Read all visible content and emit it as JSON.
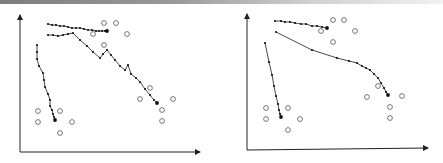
{
  "chart_data": [
    {
      "type": "scatter",
      "title": "",
      "xlabel": "",
      "ylabel": "",
      "grid": false,
      "panel": "left",
      "axes": {
        "origin": [
          20,
          152
        ],
        "x_end": [
          200,
          152
        ],
        "y_end": [
          20,
          15
        ]
      },
      "series": [
        {
          "name": "trajectory-top",
          "style": "dotted-line",
          "points": [
            [
              48,
              24
            ],
            [
              52,
              25
            ],
            [
              56,
              25
            ],
            [
              60,
              26
            ],
            [
              64,
              26
            ],
            [
              68,
              27
            ],
            [
              72,
              28
            ],
            [
              76,
              28
            ],
            [
              80,
              28
            ],
            [
              84,
              29
            ],
            [
              88,
              30
            ],
            [
              92,
              30
            ],
            [
              96,
              31
            ],
            [
              99,
              31
            ],
            [
              102,
              31
            ],
            [
              105,
              31
            ],
            [
              107,
              31
            ]
          ]
        },
        {
          "name": "trajectory-middle",
          "style": "dotted-line",
          "points": [
            [
              48,
              35
            ],
            [
              53,
              35
            ],
            [
              58,
              36
            ],
            [
              63,
              35
            ],
            [
              68,
              34
            ],
            [
              73,
              33
            ],
            [
              80,
              40
            ],
            [
              87,
              46
            ],
            [
              93,
              52
            ],
            [
              100,
              58
            ],
            [
              103,
              54
            ],
            [
              107,
              50
            ],
            [
              111,
              55
            ],
            [
              115,
              60
            ],
            [
              120,
              66
            ],
            [
              125,
              70
            ],
            [
              128,
              65
            ],
            [
              131,
              74
            ],
            [
              136,
              78
            ],
            [
              140,
              82
            ],
            [
              145,
              89
            ],
            [
              150,
              95
            ],
            [
              154,
              100
            ],
            [
              157,
              103
            ]
          ]
        },
        {
          "name": "trajectory-left",
          "style": "dotted-line",
          "points": [
            [
              37,
              45
            ],
            [
              37,
              52
            ],
            [
              37,
              59
            ],
            [
              39,
              66
            ],
            [
              43,
              73
            ],
            [
              44,
              80
            ],
            [
              45,
              87
            ],
            [
              48,
              94
            ],
            [
              50,
              100
            ],
            [
              50,
              106
            ],
            [
              52,
              110
            ],
            [
              53,
              114
            ],
            [
              54,
              117
            ],
            [
              55,
              120
            ]
          ]
        },
        {
          "name": "targets",
          "style": "open-circle",
          "points": [
            [
              104,
              23
            ],
            [
              116,
              23
            ],
            [
              93,
              34
            ],
            [
              127,
              34
            ],
            [
              104,
              45
            ],
            [
              150,
              88
            ],
            [
              140,
              99
            ],
            [
              173,
              99
            ],
            [
              162,
              110
            ],
            [
              162,
              121
            ],
            [
              38,
              111
            ],
            [
              60,
              111
            ],
            [
              38,
              122
            ],
            [
              72,
              122
            ],
            [
              60,
              133
            ]
          ]
        }
      ]
    },
    {
      "type": "scatter",
      "title": "",
      "xlabel": "",
      "ylabel": "",
      "grid": false,
      "panel": "right",
      "axes": {
        "origin": [
          247,
          150
        ],
        "x_end": [
          428,
          148
        ],
        "y_end": [
          247,
          14
        ]
      },
      "series": [
        {
          "name": "trajectory-top",
          "style": "dotted-line",
          "points": [
            [
              275,
              21
            ],
            [
              281,
              21
            ],
            [
              285,
              22
            ],
            [
              290,
              22
            ],
            [
              295,
              23
            ],
            [
              301,
              24
            ],
            [
              306,
              24
            ],
            [
              312,
              26
            ],
            [
              317,
              26
            ],
            [
              322,
              27
            ],
            [
              327,
              28
            ]
          ]
        },
        {
          "name": "trajectory-middle",
          "style": "dotted-line",
          "points": [
            [
              276,
              32
            ],
            [
              312,
              50
            ],
            [
              337,
              58
            ],
            [
              349,
              61
            ],
            [
              357,
              63
            ],
            [
              362,
              66
            ],
            [
              366,
              68
            ],
            [
              370,
              70
            ],
            [
              374,
              74
            ],
            [
              378,
              78
            ],
            [
              381,
              83
            ],
            [
              384,
              88
            ],
            [
              386,
              92
            ],
            [
              388,
              95
            ]
          ]
        },
        {
          "name": "trajectory-left",
          "style": "dotted-line",
          "points": [
            [
              265,
              43
            ],
            [
              269,
              62
            ],
            [
              272,
              75
            ],
            [
              274,
              86
            ],
            [
              276,
              96
            ],
            [
              278,
              104
            ],
            [
              279,
              110
            ],
            [
              280,
              114
            ],
            [
              281,
              117
            ]
          ]
        },
        {
          "name": "targets",
          "style": "open-circle",
          "points": [
            [
              333,
              20
            ],
            [
              344,
              20
            ],
            [
              321,
              31
            ],
            [
              355,
              31
            ],
            [
              333,
              42
            ],
            [
              378,
              86
            ],
            [
              367,
              97
            ],
            [
              402,
              96
            ],
            [
              390,
              107
            ],
            [
              390,
              118
            ],
            [
              266,
              108
            ],
            [
              288,
              108
            ],
            [
              266,
              119
            ],
            [
              300,
              119
            ],
            [
              288,
              130
            ]
          ]
        }
      ]
    }
  ],
  "colors": {
    "line": "#1a1a1a",
    "marker": "#111111",
    "circle": "#555555",
    "axis": "#222222"
  }
}
